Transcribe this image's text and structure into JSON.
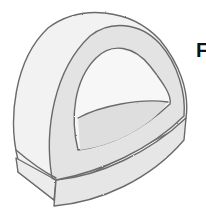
{
  "illustration": {
    "subject": "pencil-sketch-dome-arch",
    "colors": {
      "outline": "#6b6b6b",
      "outer_fill": "#f2f2f2",
      "band_fill": "#e3e3e3",
      "inner_opening": "#f7f7f7",
      "inner_floor": "#dedede",
      "base_front": "#ececec"
    }
  },
  "label": {
    "text": "F"
  }
}
